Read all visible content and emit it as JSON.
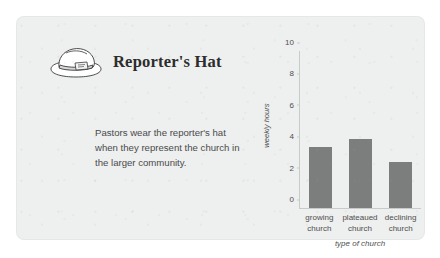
{
  "panel": {
    "background_color": "#eeefef",
    "header": {
      "icon": "reporters-hat-icon",
      "title": "Reporter's Hat"
    },
    "body_text": "Pastors wear the reporter's hat when they represent the church in the larger community."
  },
  "chart_data": {
    "type": "bar",
    "title": "",
    "categories": [
      "growing church",
      "plateaued church",
      "declining church"
    ],
    "values": [
      3.9,
      4.4,
      2.9
    ],
    "xlabel": "type of church",
    "ylabel": "weekly hours",
    "ylim": [
      0,
      10
    ],
    "yticks": [
      10,
      8,
      6,
      4,
      2,
      0
    ],
    "ytick_labels": [
      "10",
      "8",
      "6",
      "4",
      "2",
      "0"
    ],
    "grid": false,
    "legend": false,
    "bar_color": "#7c7d7d",
    "axis_color": "#c9cbcb"
  }
}
